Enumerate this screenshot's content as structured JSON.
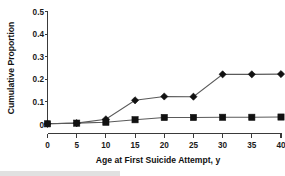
{
  "chart_data": {
    "type": "line",
    "title": "",
    "xlabel": "Age at First Suicide Attempt, y",
    "ylabel": "Cumulative Proportion",
    "xlim": [
      0,
      40
    ],
    "ylim": [
      0,
      0.5
    ],
    "grid": false,
    "legend": "none",
    "x": [
      0,
      5,
      10,
      15,
      20,
      25,
      30,
      35,
      40
    ],
    "xticks": [
      "0",
      "5",
      "10",
      "15",
      "20",
      "25",
      "30",
      "35",
      "40"
    ],
    "yticks": [
      "0",
      "0.1",
      "0.2",
      "0.3",
      "0.4",
      "0.5"
    ],
    "ytick_values": [
      0,
      0.1,
      0.2,
      0.3,
      0.4,
      0.5
    ],
    "series": [
      {
        "name": "diamond-series",
        "marker": "diamond",
        "values": [
          0.003,
          0.006,
          0.023,
          0.107,
          0.124,
          0.123,
          0.222,
          0.222,
          0.223
        ]
      },
      {
        "name": "square-series",
        "marker": "square",
        "values": [
          0.003,
          0.006,
          0.01,
          0.021,
          0.031,
          0.031,
          0.032,
          0.032,
          0.033
        ]
      }
    ],
    "colors": {
      "marker": "#111111",
      "line": "#5a5a5a",
      "axis": "#3a3a3a",
      "text": "#111111",
      "background": "#ffffff"
    }
  },
  "axes": {
    "y_title": "Cumulative Proportion",
    "x_title": "Age at First Suicide Attempt, y"
  }
}
